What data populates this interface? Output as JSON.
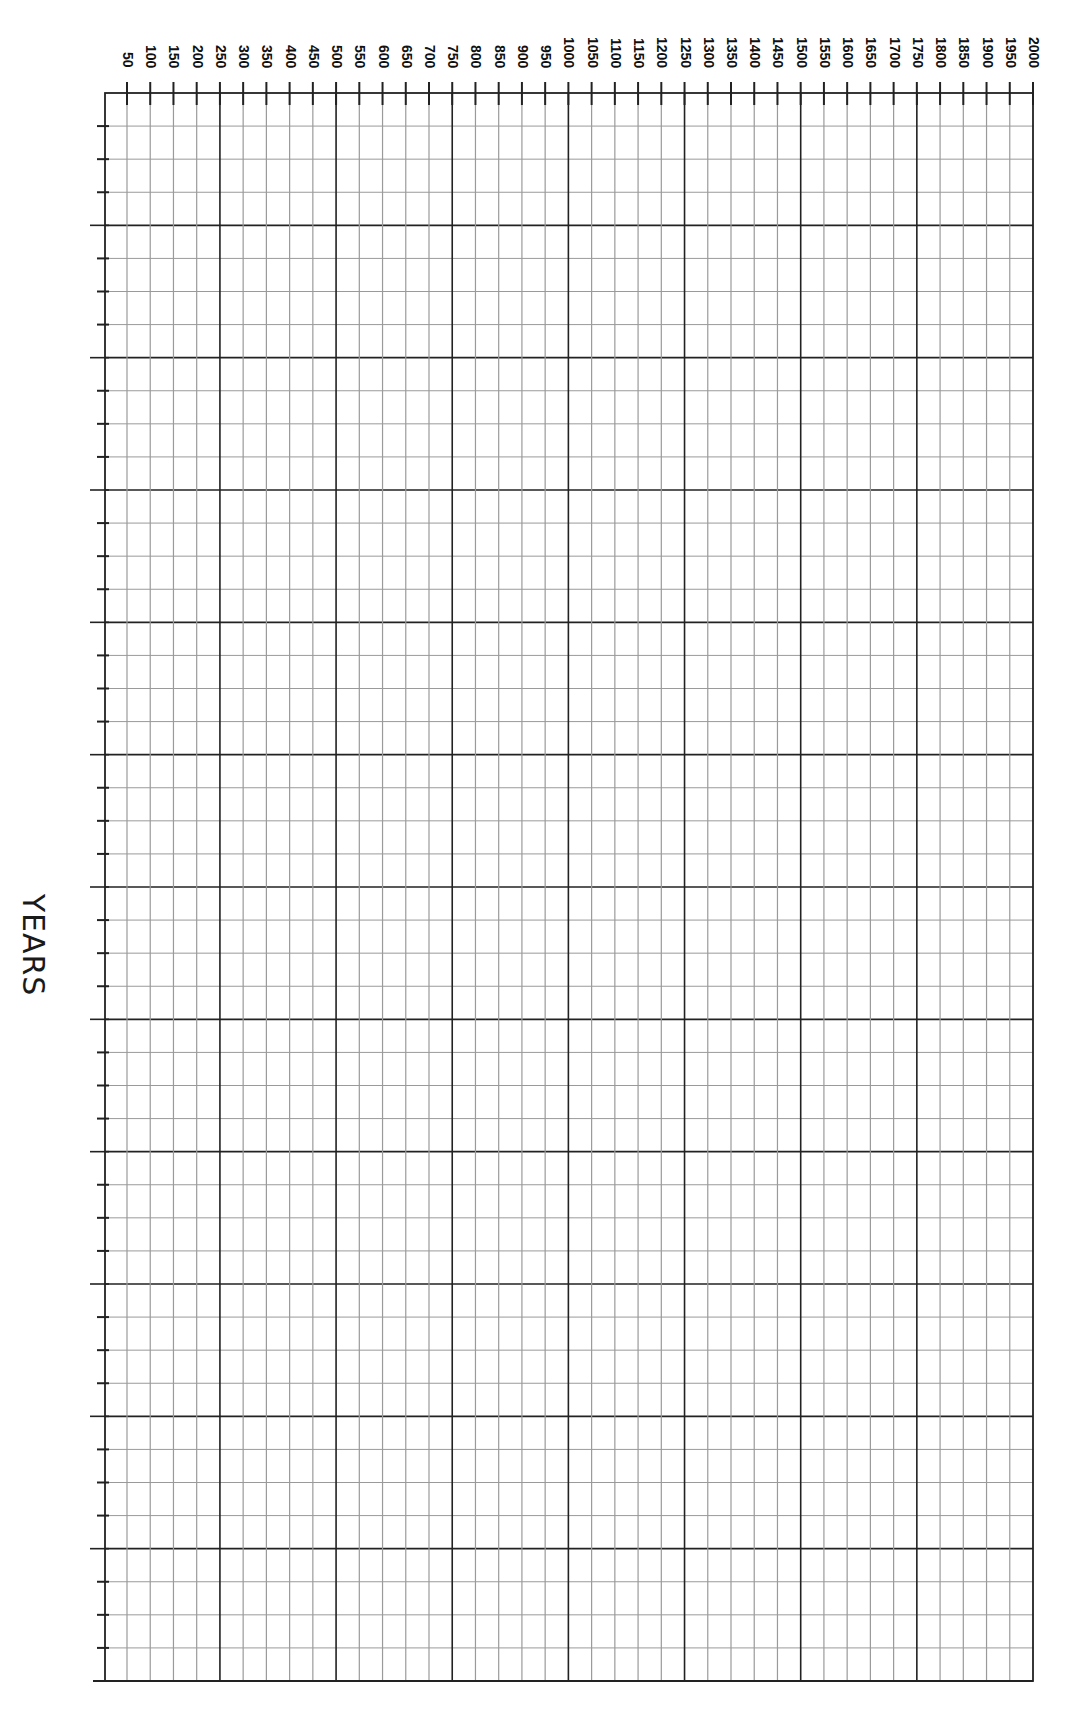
{
  "chart_data": {
    "type": "table",
    "title": "",
    "xlabel": "",
    "ylabel": "YEARS",
    "orientation": "rotated 90 degrees clockwise (years axis runs along top edge)",
    "axis": {
      "label": "YEARS",
      "start": 50,
      "end": 2000,
      "step": 50,
      "major_every": 250,
      "tick_labels": [
        "50",
        "100",
        "150",
        "200",
        "250",
        "300",
        "350",
        "400",
        "450",
        "500",
        "550",
        "600",
        "650",
        "700",
        "750",
        "800",
        "850",
        "900",
        "950",
        "1000",
        "1050",
        "1100",
        "1150",
        "1200",
        "1250",
        "1300",
        "1350",
        "1400",
        "1450",
        "1500",
        "1550",
        "1600",
        "1650",
        "1700",
        "1750",
        "1800",
        "1850",
        "1900",
        "1950",
        "2000"
      ]
    },
    "rows": {
      "major_divisions": 12,
      "minor_per_major": 4
    },
    "grid": true,
    "series": [],
    "legend": null
  },
  "colors": {
    "major_line": "#222222",
    "minor_line": "#9a9a9a",
    "border": "#222222",
    "background": "#ffffff"
  },
  "layout": {
    "left": 105,
    "top": 93,
    "right": 1033,
    "bottom": 1681,
    "first_line_x": 127
  }
}
